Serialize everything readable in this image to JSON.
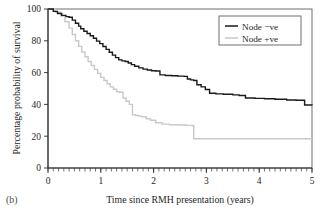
{
  "panel": {
    "label": "(b)"
  },
  "chart_data": {
    "type": "line",
    "subtype": "kaplan-meier-step",
    "title": "",
    "xlabel": "Time since RMH presentation (years)",
    "ylabel": "Percentage probability of survival",
    "xlim": [
      0,
      5
    ],
    "ylim": [
      0,
      100
    ],
    "xticks": [
      0,
      1,
      2,
      3,
      4,
      5
    ],
    "xticklabels": [
      "0",
      "1",
      "2",
      "3",
      "4",
      "5"
    ],
    "yticks": [
      0,
      20,
      40,
      60,
      80,
      100
    ],
    "yticklabels": [
      "0",
      "20",
      "40",
      "60",
      "80",
      "100"
    ],
    "minor_xtick_interval": 0.1,
    "grid": false,
    "frame": true,
    "legend_position": "top-right",
    "series": [
      {
        "name": "Node −ve",
        "color": "#1a1a1a",
        "linewidth": 1.4,
        "x": [
          0.0,
          0.1,
          0.18,
          0.26,
          0.34,
          0.4,
          0.46,
          0.52,
          0.58,
          0.62,
          0.68,
          0.74,
          0.8,
          0.86,
          0.92,
          0.98,
          1.04,
          1.1,
          1.16,
          1.22,
          1.28,
          1.34,
          1.4,
          1.46,
          1.52,
          1.58,
          1.64,
          1.72,
          1.8,
          1.88,
          1.96,
          2.04,
          2.12,
          2.22,
          2.34,
          2.46,
          2.58,
          2.64,
          2.7,
          2.76,
          2.82,
          2.9,
          2.98,
          3.06,
          3.18,
          3.32,
          3.5,
          3.62,
          3.74,
          3.92,
          4.1,
          4.3,
          4.52,
          4.7,
          4.86,
          5.0
        ],
        "y": [
          100.0,
          98.5,
          97.2,
          96.0,
          95.2,
          94.8,
          93.0,
          91.0,
          89.2,
          87.6,
          86.0,
          84.6,
          83.2,
          81.6,
          79.8,
          78.2,
          76.4,
          74.6,
          72.8,
          71.0,
          69.4,
          68.0,
          67.4,
          67.0,
          66.0,
          65.0,
          64.0,
          63.0,
          62.2,
          61.6,
          61.2,
          61.0,
          58.6,
          58.2,
          58.0,
          57.8,
          57.6,
          56.0,
          55.4,
          55.0,
          52.4,
          51.0,
          49.4,
          47.0,
          46.6,
          46.4,
          46.0,
          45.6,
          44.0,
          43.8,
          43.6,
          43.2,
          42.8,
          42.6,
          39.6,
          39.4
        ]
      },
      {
        "name": "Node +ve",
        "color": "#c9c9c9",
        "linewidth": 1.4,
        "x": [
          0.0,
          0.14,
          0.24,
          0.32,
          0.4,
          0.46,
          0.52,
          0.58,
          0.64,
          0.7,
          0.76,
          0.82,
          0.88,
          0.94,
          1.0,
          1.06,
          1.12,
          1.18,
          1.24,
          1.3,
          1.36,
          1.42,
          1.48,
          1.54,
          1.6,
          1.66,
          1.72,
          1.78,
          1.86,
          1.94,
          2.04,
          2.16,
          2.3,
          2.46,
          2.62,
          2.74,
          2.76,
          3.0,
          3.4,
          3.9,
          4.4,
          5.0
        ],
        "y": [
          100.0,
          98.0,
          95.5,
          92.0,
          88.0,
          84.0,
          80.0,
          76.5,
          73.0,
          70.0,
          67.0,
          64.5,
          62.0,
          59.5,
          57.0,
          55.0,
          53.0,
          51.0,
          49.5,
          48.0,
          47.6,
          44.0,
          42.0,
          40.0,
          33.5,
          33.0,
          32.6,
          32.2,
          31.0,
          30.0,
          28.5,
          27.6,
          27.2,
          27.0,
          26.8,
          26.6,
          18.4,
          18.4,
          18.4,
          18.4,
          18.4,
          18.4
        ]
      }
    ]
  },
  "legend": {
    "entries": [
      {
        "label": "Node −ve",
        "color": "#1a1a1a"
      },
      {
        "label": "Node +ve",
        "color": "#c9c9c9"
      }
    ]
  }
}
